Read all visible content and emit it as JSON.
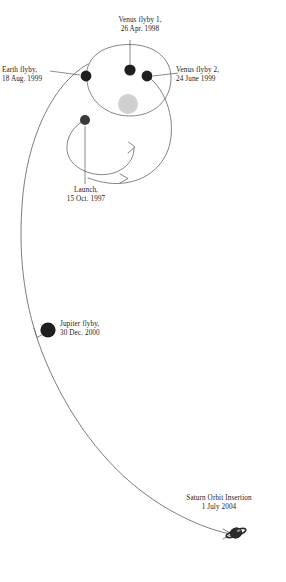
{
  "figure": {
    "background_color": "#ffffff",
    "line_color": "#6e6e6e",
    "marker_color": "#222222",
    "sun_color": "#cfcfcf",
    "text_color": "#1a1a1a"
  },
  "sun": {
    "name": "Sun",
    "cx": 128,
    "cy": 104,
    "r": 10
  },
  "events": [
    {
      "id": "venus1",
      "line1": "Venus flyby 1,",
      "line2": "26 Apr. 1998",
      "marker": {
        "cx": 130,
        "cy": 70,
        "r": 5.4
      },
      "leader": {
        "x1": 130,
        "y1": 65,
        "x2": 130,
        "y2": 40
      }
    },
    {
      "id": "earth",
      "line1": "Earth flyby,",
      "line2": "18 Aug. 1999",
      "marker": {
        "cx": 86,
        "cy": 76,
        "r": 5.4
      },
      "leader": {
        "x1": 81,
        "y1": 76,
        "x2": 52,
        "y2": 71
      }
    },
    {
      "id": "venus2",
      "line1": "Venus flyby 2,",
      "line2": "24 June 1999",
      "marker": {
        "cx": 147,
        "cy": 76,
        "r": 5.4
      },
      "leader": {
        "x1": 152,
        "y1": 76,
        "x2": 177,
        "y2": 73
      }
    },
    {
      "id": "launch",
      "line1": "Launch,",
      "line2": "15 Oct. 1997",
      "marker": {
        "cx": 85,
        "cy": 120,
        "r": 5.0
      },
      "leader": {
        "x1": 85,
        "y1": 126,
        "x2": 85,
        "y2": 184
      }
    },
    {
      "id": "jupiter",
      "line1": "Jupiter flyby,",
      "line2": "30 Dec. 2000",
      "marker": {
        "cx": 48,
        "cy": 330,
        "r": 7.4
      },
      "leader": null
    },
    {
      "id": "saturn",
      "line1": "Saturn Orbit Insertion",
      "line2": "1 July 2004",
      "marker": {
        "cx": 236,
        "cy": 534,
        "r": 6.0
      },
      "leader": null
    }
  ],
  "paths": {
    "venus_orbit": "M 86,76 A 43,37 0 1 1 147,76",
    "inner_spiral": "M 85,120 C 66,132 64,160 88,170 C 112,180 136,166 134,148",
    "outer_spiral": "M 152,78 C 176,98 178,150 148,172 C 126,188 106,186 92,180",
    "cruise": "M 88,64 C 44,96 18,182 26,252 C 32,318 62,400 108,462 C 148,514 200,534 232,534"
  },
  "arrows": [
    {
      "id": "inner-arrow",
      "tip_x": 136,
      "tip_y": 147
    },
    {
      "id": "outer-arrow",
      "tip_x": 128,
      "tip_y": 178
    },
    {
      "id": "jupiter-arrow",
      "tip_x": 36,
      "tip_y": 336
    },
    {
      "id": "saturn-arrow",
      "tip_x": 232,
      "tip_y": 534
    }
  ]
}
